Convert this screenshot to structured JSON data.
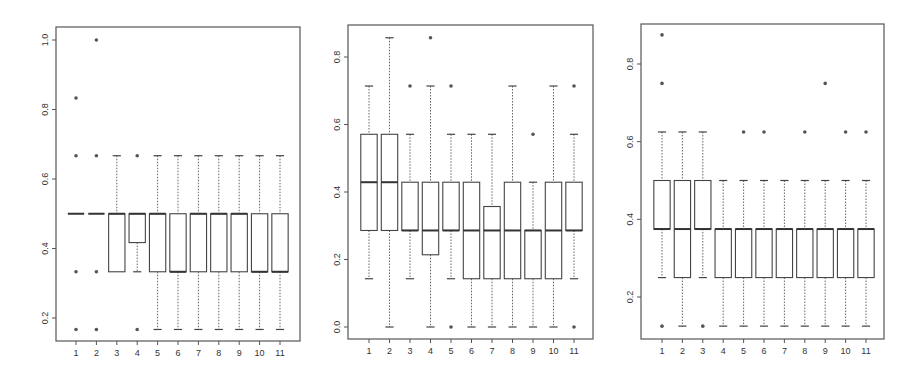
{
  "chart_data": [
    {
      "type": "boxplot",
      "title": "",
      "xlabel": "",
      "ylabel": "",
      "categories": [
        "1",
        "2",
        "3",
        "4",
        "5",
        "6",
        "7",
        "8",
        "9",
        "10",
        "11"
      ],
      "yticks": [
        0.2,
        0.4,
        0.6,
        0.8,
        1.0
      ],
      "ytick_labels": [
        "0.2",
        "0.4",
        "0.6",
        "0.8",
        "1.0"
      ],
      "ylim": [
        0.13,
        1.04
      ],
      "frame": {
        "x0": 56,
        "x1": 300,
        "y0": 27,
        "y1": 341
      },
      "ymap": {
        "v_top": 1.0,
        "px_top": 40,
        "v_bot": 0.2,
        "px_bot": 318
      },
      "xmap": {
        "first": 76,
        "last": 280
      },
      "boxes": [
        {
          "wlo": 0.5,
          "q1": 0.5,
          "med": 0.5,
          "q3": 0.5,
          "whi": 0.5,
          "outliers": [
            0.833,
            0.667,
            0.333,
            0.167
          ]
        },
        {
          "wlo": 0.5,
          "q1": 0.5,
          "med": 0.5,
          "q3": 0.5,
          "whi": 0.5,
          "outliers": [
            1.0,
            0.667,
            0.333,
            0.167
          ]
        },
        {
          "wlo": 0.333,
          "q1": 0.333,
          "med": 0.5,
          "q3": 0.5,
          "whi": 0.667,
          "outliers": []
        },
        {
          "wlo": 0.333,
          "q1": 0.417,
          "med": 0.5,
          "q3": 0.5,
          "whi": 0.5,
          "outliers": [
            0.667,
            0.167
          ]
        },
        {
          "wlo": 0.167,
          "q1": 0.333,
          "med": 0.5,
          "q3": 0.5,
          "whi": 0.667,
          "outliers": []
        },
        {
          "wlo": 0.167,
          "q1": 0.333,
          "med": 0.333,
          "q3": 0.5,
          "whi": 0.667,
          "outliers": []
        },
        {
          "wlo": 0.167,
          "q1": 0.333,
          "med": 0.5,
          "q3": 0.5,
          "whi": 0.667,
          "outliers": []
        },
        {
          "wlo": 0.167,
          "q1": 0.333,
          "med": 0.5,
          "q3": 0.5,
          "whi": 0.667,
          "outliers": []
        },
        {
          "wlo": 0.167,
          "q1": 0.333,
          "med": 0.5,
          "q3": 0.5,
          "whi": 0.667,
          "outliers": []
        },
        {
          "wlo": 0.167,
          "q1": 0.333,
          "med": 0.333,
          "q3": 0.5,
          "whi": 0.667,
          "outliers": []
        },
        {
          "wlo": 0.167,
          "q1": 0.333,
          "med": 0.333,
          "q3": 0.5,
          "whi": 0.667,
          "outliers": []
        }
      ]
    },
    {
      "type": "boxplot",
      "title": "",
      "xlabel": "",
      "ylabel": "",
      "categories": [
        "1",
        "2",
        "3",
        "4",
        "5",
        "6",
        "7",
        "8",
        "9",
        "10",
        "11"
      ],
      "yticks": [
        0.0,
        0.2,
        0.4,
        0.6,
        0.8
      ],
      "ytick_labels": [
        "0.0",
        "0.2",
        "0.4",
        "0.6",
        "0.8"
      ],
      "ylim": [
        -0.03,
        0.9
      ],
      "frame": {
        "x0": 348,
        "x1": 593,
        "y0": 25,
        "y1": 339
      },
      "ymap": {
        "v_top": 0.8,
        "px_top": 57,
        "v_bot": 0.0,
        "px_bot": 327
      },
      "xmap": {
        "first": 369,
        "last": 574
      },
      "boxes": [
        {
          "wlo": 0.143,
          "q1": 0.286,
          "med": 0.429,
          "q3": 0.571,
          "whi": 0.714,
          "outliers": []
        },
        {
          "wlo": 0.0,
          "q1": 0.286,
          "med": 0.429,
          "q3": 0.571,
          "whi": 0.857,
          "outliers": []
        },
        {
          "wlo": 0.143,
          "q1": 0.286,
          "med": 0.286,
          "q3": 0.429,
          "whi": 0.571,
          "outliers": [
            0.714
          ]
        },
        {
          "wlo": 0.0,
          "q1": 0.214,
          "med": 0.286,
          "q3": 0.429,
          "whi": 0.714,
          "outliers": [
            0.857
          ]
        },
        {
          "wlo": 0.143,
          "q1": 0.286,
          "med": 0.286,
          "q3": 0.429,
          "whi": 0.571,
          "outliers": [
            0.714,
            0.0
          ]
        },
        {
          "wlo": 0.0,
          "q1": 0.143,
          "med": 0.286,
          "q3": 0.429,
          "whi": 0.571,
          "outliers": []
        },
        {
          "wlo": 0.0,
          "q1": 0.143,
          "med": 0.286,
          "q3": 0.357,
          "whi": 0.571,
          "outliers": []
        },
        {
          "wlo": 0.0,
          "q1": 0.143,
          "med": 0.286,
          "q3": 0.429,
          "whi": 0.714,
          "outliers": []
        },
        {
          "wlo": 0.0,
          "q1": 0.143,
          "med": 0.286,
          "q3": 0.286,
          "whi": 0.429,
          "outliers": [
            0.571
          ]
        },
        {
          "wlo": 0.0,
          "q1": 0.143,
          "med": 0.286,
          "q3": 0.429,
          "whi": 0.714,
          "outliers": []
        },
        {
          "wlo": 0.143,
          "q1": 0.286,
          "med": 0.286,
          "q3": 0.429,
          "whi": 0.571,
          "outliers": [
            0.714,
            0.0
          ]
        }
      ]
    },
    {
      "type": "boxplot",
      "title": "",
      "xlabel": "",
      "ylabel": "",
      "categories": [
        "1",
        "2",
        "3",
        "4",
        "5",
        "6",
        "7",
        "8",
        "9",
        "10",
        "11"
      ],
      "yticks": [
        0.2,
        0.4,
        0.6,
        0.8
      ],
      "ytick_labels": [
        "0.2",
        "0.4",
        "0.6",
        "0.8"
      ],
      "ylim": [
        0.1,
        0.91
      ],
      "frame": {
        "x0": 641,
        "x1": 884,
        "y0": 24,
        "y1": 339
      },
      "ymap": {
        "v_top": 0.8,
        "px_top": 64,
        "v_bot": 0.2,
        "px_bot": 297
      },
      "xmap": {
        "first": 662,
        "last": 866
      },
      "boxes": [
        {
          "wlo": 0.25,
          "q1": 0.375,
          "med": 0.375,
          "q3": 0.5,
          "whi": 0.625,
          "outliers": [
            0.875,
            0.75,
            0.125
          ]
        },
        {
          "wlo": 0.125,
          "q1": 0.25,
          "med": 0.375,
          "q3": 0.5,
          "whi": 0.625,
          "outliers": []
        },
        {
          "wlo": 0.25,
          "q1": 0.375,
          "med": 0.375,
          "q3": 0.5,
          "whi": 0.625,
          "outliers": [
            0.125
          ]
        },
        {
          "wlo": 0.125,
          "q1": 0.25,
          "med": 0.375,
          "q3": 0.375,
          "whi": 0.5,
          "outliers": []
        },
        {
          "wlo": 0.125,
          "q1": 0.25,
          "med": 0.375,
          "q3": 0.375,
          "whi": 0.5,
          "outliers": [
            0.625
          ]
        },
        {
          "wlo": 0.125,
          "q1": 0.25,
          "med": 0.375,
          "q3": 0.375,
          "whi": 0.5,
          "outliers": [
            0.625
          ]
        },
        {
          "wlo": 0.125,
          "q1": 0.25,
          "med": 0.375,
          "q3": 0.375,
          "whi": 0.5,
          "outliers": []
        },
        {
          "wlo": 0.125,
          "q1": 0.25,
          "med": 0.375,
          "q3": 0.375,
          "whi": 0.5,
          "outliers": [
            0.625
          ]
        },
        {
          "wlo": 0.125,
          "q1": 0.25,
          "med": 0.375,
          "q3": 0.375,
          "whi": 0.5,
          "outliers": [
            0.75
          ]
        },
        {
          "wlo": 0.125,
          "q1": 0.25,
          "med": 0.375,
          "q3": 0.375,
          "whi": 0.5,
          "outliers": [
            0.625
          ]
        },
        {
          "wlo": 0.125,
          "q1": 0.25,
          "med": 0.375,
          "q3": 0.375,
          "whi": 0.5,
          "outliers": [
            0.625
          ]
        }
      ]
    }
  ]
}
